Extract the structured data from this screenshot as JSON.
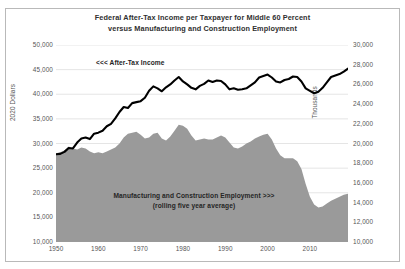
{
  "chart_data": {
    "type": "line",
    "title": "Federal After-Tax Income per Taxpayer for Middle 60 Percent versus Manufacturing and Construction Employment",
    "title_lines": [
      "Federal After-Tax Income per Taxpayer for Middle 60 Percent",
      "versus Manufacturing and Construction Employment"
    ],
    "xlabel": "",
    "ylabel": "2020 Dollars",
    "y2label": "Thousands",
    "xlim": [
      1950,
      2019
    ],
    "ylim": [
      10000,
      50000
    ],
    "y2lim": [
      10000,
      30000
    ],
    "grid": true,
    "legend_position": "inline-annotations",
    "annotations": [
      {
        "text": "<<< After-Tax Income",
        "series": "After-Tax Income"
      },
      {
        "text": "Manufacturing and Construction Employment >>>",
        "series": "Manufacturing and Construction Employment"
      },
      {
        "text": "(rolling five year average)",
        "series": "Manufacturing and Construction Employment"
      }
    ],
    "xticks": [
      "1950",
      "1960",
      "1970",
      "1980",
      "1990",
      "2000",
      "2010"
    ],
    "xtick_values": [
      1950,
      1960,
      1970,
      1980,
      1990,
      2000,
      2010
    ],
    "yticks": [
      "10,000",
      "15,000",
      "20,000",
      "25,000",
      "30,000",
      "35,000",
      "40,000",
      "45,000",
      "50,000"
    ],
    "ytick_values": [
      10000,
      15000,
      20000,
      25000,
      30000,
      35000,
      40000,
      45000,
      50000
    ],
    "y2ticks": [
      "10,000",
      "12,000",
      "14,000",
      "16,000",
      "18,000",
      "20,000",
      "22,000",
      "24,000",
      "26,000",
      "28,000",
      "30,000"
    ],
    "y2tick_values": [
      10000,
      12000,
      14000,
      16000,
      18000,
      20000,
      22000,
      24000,
      26000,
      28000,
      30000
    ],
    "colors": {
      "income_line": "#000000",
      "employment_area": "#9a9a9a",
      "gridline": "#e2e2e2",
      "axis": "#9a9a9a",
      "text": "#3b3b3b",
      "frame": "#b9b9b9"
    },
    "x": [
      1950,
      1951,
      1952,
      1953,
      1954,
      1955,
      1956,
      1957,
      1958,
      1959,
      1960,
      1961,
      1962,
      1963,
      1964,
      1965,
      1966,
      1967,
      1968,
      1969,
      1970,
      1971,
      1972,
      1973,
      1974,
      1975,
      1976,
      1977,
      1978,
      1979,
      1980,
      1981,
      1982,
      1983,
      1984,
      1985,
      1986,
      1987,
      1988,
      1989,
      1990,
      1991,
      1992,
      1993,
      1994,
      1995,
      1996,
      1997,
      1998,
      1999,
      2000,
      2001,
      2002,
      2003,
      2004,
      2005,
      2006,
      2007,
      2008,
      2009,
      2010,
      2011,
      2012,
      2013,
      2014,
      2015,
      2016,
      2017,
      2018,
      2019
    ],
    "series": [
      {
        "name": "After-Tax Income",
        "axis": "left",
        "type": "line",
        "color": "#000000",
        "unit": "2020 Dollars per taxpayer",
        "values": [
          27800,
          27900,
          28300,
          29100,
          29000,
          30200,
          31000,
          31200,
          30900,
          32000,
          32200,
          32600,
          33500,
          34000,
          35100,
          36400,
          37400,
          37200,
          38200,
          38400,
          38600,
          39300,
          40700,
          41600,
          41200,
          40600,
          41400,
          42000,
          42800,
          43500,
          42600,
          42000,
          41300,
          41000,
          41700,
          42100,
          42800,
          42500,
          42800,
          42700,
          42000,
          41000,
          41200,
          40900,
          41000,
          41200,
          41800,
          42400,
          43400,
          43700,
          44000,
          43400,
          42600,
          42400,
          42900,
          43100,
          43600,
          43500,
          42600,
          41200,
          40700,
          40200,
          40500,
          41300,
          42400,
          43500,
          43800,
          44100,
          44600,
          45200
        ]
      },
      {
        "name": "Manufacturing and Construction Employment",
        "axis": "right",
        "type": "area",
        "color": "#9a9a9a",
        "unit": "Thousands (rolling five year average)",
        "values": [
          19000,
          19100,
          19300,
          19700,
          19500,
          19400,
          19600,
          19500,
          19200,
          19000,
          19100,
          19000,
          19200,
          19400,
          19600,
          20000,
          20600,
          21000,
          21100,
          21200,
          20900,
          20500,
          20600,
          21000,
          21100,
          20500,
          20300,
          20700,
          21300,
          21900,
          21800,
          21500,
          20800,
          20300,
          20400,
          20500,
          20400,
          20400,
          20600,
          20800,
          20600,
          20100,
          19600,
          19500,
          19700,
          20000,
          20200,
          20500,
          20700,
          20900,
          21000,
          20400,
          19500,
          18800,
          18500,
          18500,
          18500,
          18200,
          17400,
          15900,
          14600,
          13800,
          13500,
          13600,
          13900,
          14200,
          14400,
          14600,
          14800,
          14900
        ]
      }
    ]
  }
}
